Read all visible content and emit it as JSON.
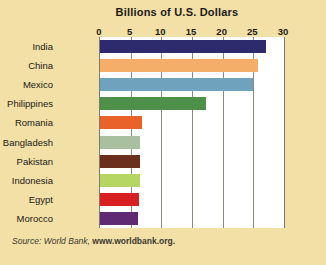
{
  "figure": {
    "background_color": "#f2e0a6",
    "plot_background_color": "#ffffff",
    "axis_color": "#8d8a80"
  },
  "source": {
    "prefix": "Source: World Bank, ",
    "url": "www.worldbank.org."
  },
  "chart_data": {
    "type": "bar",
    "orientation": "horizontal",
    "title": "Billions of U.S. Dollars",
    "xlabel": "",
    "ylabel": "",
    "xlim": [
      0,
      30
    ],
    "grid": true,
    "grid_axis": "x",
    "legend": "none",
    "tick_labels": [
      "0",
      "5",
      "10",
      "15",
      "20",
      "25",
      "30"
    ],
    "ticks": [
      0,
      5,
      10,
      15,
      20,
      25,
      30
    ],
    "categories": [
      "India",
      "China",
      "Mexico",
      "Philippines",
      "Romania",
      "Bangladesh",
      "Pakistan",
      "Indonesia",
      "Egypt",
      "Morocco"
    ],
    "values": [
      27.0,
      25.7,
      25.0,
      17.3,
      6.8,
      6.6,
      6.6,
      6.5,
      6.3,
      6.2
    ],
    "colors": [
      "#2e2a6e",
      "#f5ad6a",
      "#6fa3bd",
      "#4f9049",
      "#e8622a",
      "#a8bfa0",
      "#6b2f1e",
      "#b5d663",
      "#d81f22",
      "#5f2a73"
    ]
  }
}
